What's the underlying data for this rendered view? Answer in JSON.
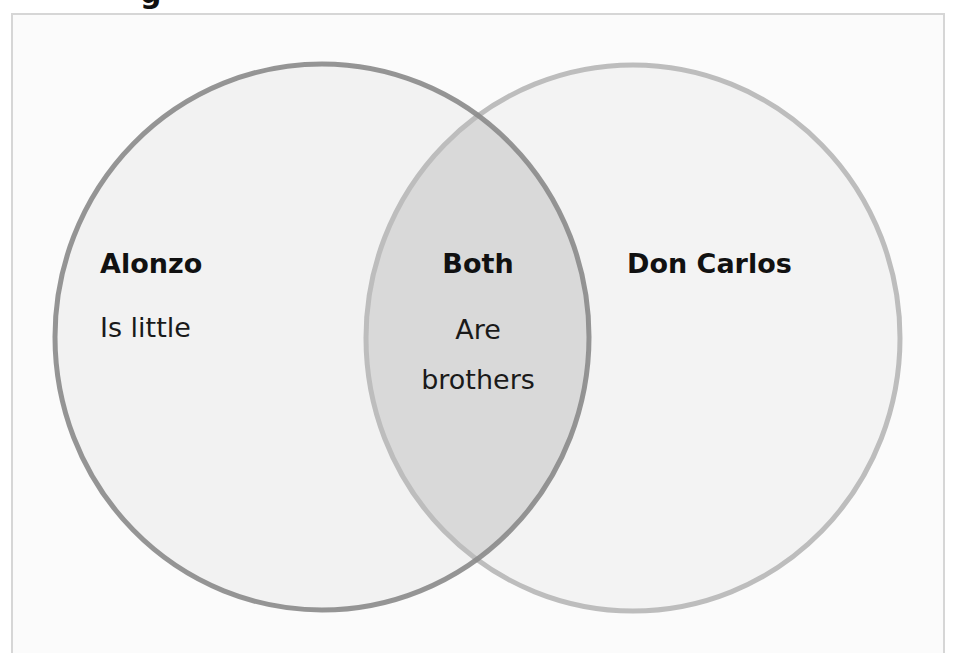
{
  "header": {
    "title_fragment": "g"
  },
  "diagram": {
    "type": "venn",
    "colors": {
      "background": "#fbfbfb",
      "left_circle_fill": "#f2f2f2",
      "left_circle_stroke": "#8a8a8a",
      "right_circle_fill": "#f3f3f3",
      "right_circle_stroke": "#bdbdbd",
      "overlap_fill": "#d9d9d9"
    },
    "left": {
      "heading": "Alonzo",
      "items": [
        "Is little"
      ]
    },
    "overlap": {
      "heading": "Both",
      "items": [
        "Are",
        "brothers"
      ]
    },
    "right": {
      "heading": "Don Carlos",
      "items": []
    }
  }
}
